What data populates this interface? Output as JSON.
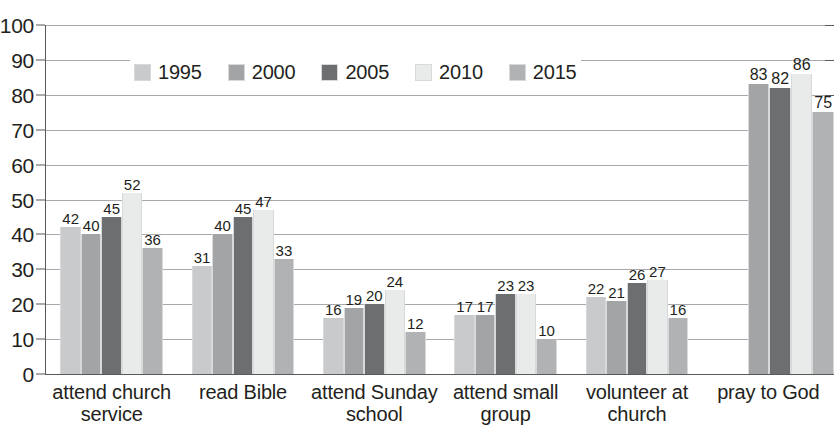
{
  "chart_data": {
    "type": "bar",
    "title": "",
    "subtitle": "",
    "xlabel": "",
    "ylabel": "",
    "ylim": [
      0,
      100
    ],
    "ytick_step": 10,
    "yticks": [
      "100",
      "90",
      "80",
      "70",
      "60",
      "50",
      "40",
      "30",
      "20",
      "10",
      "0"
    ],
    "grid": true,
    "legend_position": "inside-top-left",
    "categories": [
      "attend church service",
      "read Bible",
      "attend Sunday school",
      "attend small group",
      "volunteer at church",
      "pray to God"
    ],
    "category_lines": [
      [
        "attend church",
        "service"
      ],
      [
        "read Bible",
        ""
      ],
      [
        "attend Sunday",
        "school"
      ],
      [
        "attend small",
        "group"
      ],
      [
        "volunteer at",
        "church"
      ],
      [
        "pray to God",
        ""
      ]
    ],
    "series": [
      {
        "name": "1995",
        "color": "#c9cacb",
        "values": [
          42,
          31,
          16,
          17,
          22,
          null
        ]
      },
      {
        "name": "2000",
        "color": "#a2a4a6",
        "values": [
          40,
          40,
          19,
          17,
          21,
          83
        ]
      },
      {
        "name": "2005",
        "color": "#6d6e70",
        "values": [
          45,
          45,
          20,
          23,
          26,
          82
        ]
      },
      {
        "name": "2010",
        "color": "#e9eaea",
        "values": [
          52,
          47,
          24,
          23,
          27,
          86
        ]
      },
      {
        "name": "2015",
        "color": "#b0b2b4",
        "values": [
          36,
          33,
          12,
          10,
          16,
          75
        ]
      }
    ]
  },
  "legend": {
    "items": [
      {
        "label": "1995",
        "color": "#c9cacb"
      },
      {
        "label": "2000",
        "color": "#a2a4a6"
      },
      {
        "label": "2005",
        "color": "#6d6e70"
      },
      {
        "label": "2010",
        "color": "#e9eaea"
      },
      {
        "label": "2015",
        "color": "#b0b2b4"
      }
    ]
  },
  "colors": {
    "axis": "#58595b",
    "gridline": "#a7a9ac",
    "text": "#231f20",
    "background": "#ffffff",
    "bar_outline": "#d8d9da"
  }
}
